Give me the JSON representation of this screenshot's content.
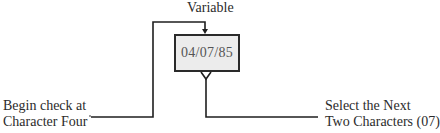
{
  "diagram": {
    "title": "Variable",
    "box": {
      "value": "04/07/85",
      "fill": "#ececec",
      "border": "#2a2a2a"
    },
    "left_annotation": {
      "line1": "Begin check at",
      "line2": "Character Four"
    },
    "right_annotation": {
      "line1": "Select the Next",
      "line2": "Two Characters (07)"
    },
    "line_color": "#1f1f1f"
  }
}
